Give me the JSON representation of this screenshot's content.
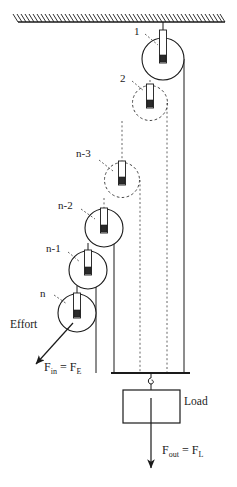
{
  "figure": {
    "type": "physics-mechanics-diagram",
    "width": 237,
    "height": 487,
    "background_color": "#ffffff",
    "line_color": "#1a1a1a"
  },
  "ceiling": {
    "name": "fixed-support-ceiling",
    "y": 22,
    "x_start": 18,
    "x_end": 225,
    "hatching": "diagonal-hatch"
  },
  "pulleys": [
    {
      "label": "1",
      "cx": 163,
      "cy": 59,
      "r": 21,
      "style": "solid",
      "label_x": 134,
      "label_y": 31
    },
    {
      "label": "2",
      "cx": 150,
      "cy": 103,
      "r": 17.5,
      "style": "dashed",
      "label_x": 121,
      "label_y": 78
    },
    {
      "label": "n-3",
      "cx": 122,
      "cy": 180,
      "r": 17.5,
      "style": "dashed",
      "label_x": 79,
      "label_y": 153
    },
    {
      "label": "n-2",
      "cx": 104,
      "cy": 228,
      "r": 19,
      "style": "solid",
      "label_x": 60,
      "label_y": 206
    },
    {
      "label": "n-1",
      "cx": 88,
      "cy": 270,
      "r": 19,
      "style": "solid",
      "label_x": 48,
      "label_y": 249
    },
    {
      "label": "n",
      "cx": 77,
      "cy": 313,
      "r": 19,
      "style": "solid",
      "label_x": 40,
      "label_y": 293
    }
  ],
  "labels": {
    "effort": "Effort",
    "load": "Load",
    "force_in": "F",
    "force_in_sub1": "in",
    "force_in_eq": " = F",
    "force_in_sub2": "E",
    "force_out": "F",
    "force_out_sub1": "out",
    "force_out_eq": " = F",
    "force_out_sub2": "L"
  },
  "effort_arrow": {
    "name": "effort-force-arrow",
    "from_x": 73,
    "from_y": 323,
    "to_x": 35,
    "to_y": 365,
    "text": "Effort",
    "text_x": 10,
    "text_y": 325
  },
  "load": {
    "name": "load-block",
    "box_x": 123,
    "box_y": 390,
    "box_width": 57,
    "box_height": 33,
    "text": "Load",
    "text_x": 184,
    "text_y": 402,
    "hook_x": 151,
    "hook_top_y": 373,
    "arrow_to_y": 470,
    "force_text_x": 162,
    "force_text_y": 450
  },
  "bottom_bar": {
    "name": "lower-support-bar",
    "y": 373,
    "x_start": 111,
    "x_end": 190
  },
  "ropes": {
    "solid_verticals": [
      {
        "x": 114,
        "y1": 228,
        "y2": 373
      },
      {
        "x": 96,
        "y1": 270,
        "y2": 373
      },
      {
        "x": 184,
        "y1": 59,
        "y2": 373
      }
    ],
    "dashed_verticals": [
      {
        "x": 140,
        "y1": 180,
        "y2": 373
      },
      {
        "x": 167,
        "y1": 103,
        "y2": 373
      }
    ]
  }
}
